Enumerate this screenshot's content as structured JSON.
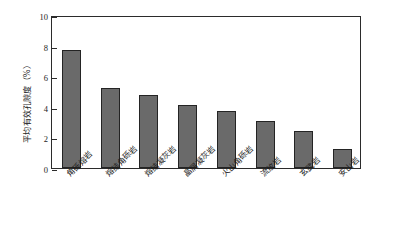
{
  "chart_data": {
    "type": "bar",
    "title": "",
    "subtitle": "",
    "xlabel": "",
    "ylabel": "平均有效孔隙度（%）",
    "categories": [
      "角砾熔岩",
      "熔结角砾岩",
      "熔结凝灰岩",
      "晶屑凝灰岩",
      "火山角砾岩",
      "流纹岩",
      "玄武岩",
      "安山岩"
    ],
    "values": [
      7.7,
      5.2,
      4.8,
      4.1,
      3.7,
      3.1,
      2.4,
      1.25
    ],
    "ylim": [
      0,
      10
    ],
    "yticks": [
      0,
      2,
      4,
      6,
      8,
      10
    ],
    "ytick_labels": [
      "0",
      "2",
      "4",
      "6",
      "8",
      "10"
    ],
    "grid": false,
    "legend": false,
    "legend_position": "none",
    "bar_color": "#6a6a6a",
    "bar_edge_color": "#242424",
    "axis_color": "#2b2b2b",
    "background_color": "#ffffff"
  }
}
